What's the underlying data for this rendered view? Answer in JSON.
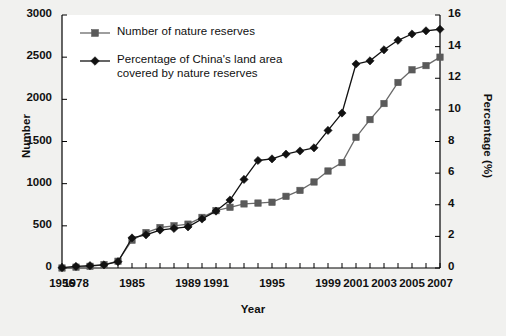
{
  "chart_data": {
    "type": "line",
    "title": "",
    "xlabel": "Year",
    "ylabel": "Number",
    "y2label": "Percentage (%)",
    "ylim": [
      0,
      3000
    ],
    "y2lim": [
      0,
      16
    ],
    "ytick_labels": [
      "0",
      "500",
      "1000",
      "1500",
      "2000",
      "2500",
      "3000"
    ],
    "ytick_values": [
      0,
      500,
      1000,
      1500,
      2000,
      2500,
      3000
    ],
    "y2tick_labels": [
      "0",
      "2",
      "4",
      "6",
      "8",
      "10",
      "12",
      "14",
      "16"
    ],
    "y2tick_values": [
      0,
      2,
      4,
      6,
      8,
      10,
      12,
      14,
      16
    ],
    "grid": false,
    "legend_position": "upper-left-inside",
    "x": [
      1956,
      1978,
      1980,
      1982,
      1984,
      1985,
      1986,
      1987,
      1988,
      1989,
      1990,
      1991,
      1992,
      1993,
      1994,
      1995,
      1996,
      1997,
      1998,
      1999,
      2000,
      2001,
      2002,
      2003,
      2004,
      2005,
      2006,
      2007
    ],
    "xtick_labels": [
      "1956",
      "1978",
      "1985",
      "1989",
      "1991",
      "1995",
      "1999",
      "2001",
      "2003",
      "2005",
      "2007"
    ],
    "xtick_indices": [
      0,
      1,
      5,
      9,
      11,
      15,
      19,
      21,
      23,
      25,
      27
    ],
    "series": [
      {
        "name": "Number of nature reserves",
        "axis": "left",
        "marker": "square",
        "color": "#5a5a5a",
        "line_color": "#6a6a6a",
        "values": [
          0,
          10,
          20,
          40,
          80,
          330,
          420,
          480,
          500,
          520,
          600,
          680,
          720,
          760,
          770,
          780,
          850,
          920,
          1020,
          1150,
          1250,
          1550,
          1760,
          1950,
          2200,
          2350,
          2400,
          2500
        ]
      },
      {
        "name": "Percentage of China's land area covered by nature reserves",
        "axis": "right",
        "marker": "diamond",
        "color": "#111111",
        "line_color": "#111111",
        "values": [
          0.02,
          0.1,
          0.15,
          0.2,
          0.4,
          1.9,
          2.1,
          2.4,
          2.5,
          2.6,
          3.1,
          3.6,
          4.3,
          5.6,
          6.8,
          6.9,
          7.2,
          7.4,
          7.6,
          8.7,
          9.8,
          12.9,
          13.1,
          13.8,
          14.4,
          14.8,
          15.0,
          15.1
        ]
      }
    ],
    "legend": [
      {
        "label": "Number of nature reserves",
        "marker": "square",
        "color": "#5a5a5a"
      },
      {
        "label": "Percentage of China's land area",
        "label2": "covered by nature reserves",
        "marker": "diamond",
        "color": "#111111"
      }
    ]
  },
  "colors": {
    "background": "#f1f1ef",
    "plot_background": "#ffffff",
    "axis": "#000000",
    "series_number": "#5a5a5a",
    "series_percentage": "#111111"
  }
}
